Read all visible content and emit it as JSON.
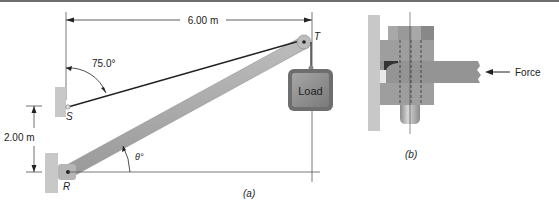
{
  "figure_a": {
    "caption": "(a)",
    "dim_horizontal": "6.00 m",
    "dim_vertical": "2.00 m",
    "angle_cable": "75.0°",
    "angle_boom": "θ°",
    "point_s": "S",
    "point_r": "R",
    "point_t": "T",
    "load_label": "Load"
  },
  "figure_b": {
    "caption": "(b)",
    "force_label": "Force"
  },
  "colors": {
    "wall": "#c8c8c8",
    "boom": "#a9a9a9",
    "load_fill": "#8c8c8c",
    "line": "#333333"
  }
}
